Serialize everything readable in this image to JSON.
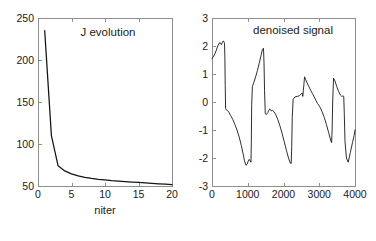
{
  "figure": {
    "background_color": "#ffffff",
    "axis_color": "#8e8e8e",
    "line_color": "#141414",
    "panel_count": 2
  },
  "chart_data": [
    {
      "id": "j-evolution",
      "type": "line",
      "title": "J evolution",
      "xlabel": "niter",
      "ylabel": "",
      "xlim": [
        0,
        20
      ],
      "ylim": [
        50,
        250
      ],
      "xticks": [
        0,
        5,
        10,
        15,
        20
      ],
      "xticklabels": [
        "0",
        "5",
        "10",
        "15",
        "20"
      ],
      "yticks": [
        50,
        100,
        150,
        200,
        250
      ],
      "yticklabels": [
        "50",
        "100",
        "150",
        "200",
        "250"
      ],
      "grid": false,
      "legend": null,
      "series": [
        {
          "name": "J",
          "x": [
            1,
            2,
            3,
            4,
            5,
            6,
            7,
            8,
            9,
            10,
            11,
            12,
            13,
            14,
            15,
            16,
            17,
            18,
            19,
            20
          ],
          "values": [
            235,
            110,
            74,
            68,
            64.5,
            62,
            60.3,
            59,
            58,
            57.2,
            56.4,
            55.8,
            55.2,
            54.7,
            54.2,
            53.8,
            53.2,
            52.6,
            52.1,
            51.5
          ]
        }
      ]
    },
    {
      "id": "denoised-signal",
      "type": "line",
      "title": "denoised signal",
      "xlabel": "",
      "ylabel": "",
      "xlim": [
        0,
        4000
      ],
      "ylim": [
        -3,
        3
      ],
      "xticks": [
        0,
        1000,
        2000,
        3000,
        4000
      ],
      "xticklabels": [
        "0",
        "1000",
        "2000",
        "3000",
        "4000"
      ],
      "yticks": [
        -3,
        -2,
        -1,
        0,
        1,
        2,
        3
      ],
      "yticklabels": [
        "-3",
        "-2",
        "-1",
        "0",
        "1",
        "2",
        "3"
      ],
      "grid": false,
      "legend": null,
      "series": [
        {
          "name": "denoised",
          "x": [
            0,
            40,
            80,
            120,
            160,
            200,
            230,
            260,
            290,
            310,
            330,
            350,
            360,
            370,
            380,
            400,
            430,
            470,
            520,
            580,
            640,
            700,
            760,
            820,
            870,
            910,
            950,
            985,
            1010,
            1040,
            1070,
            1090,
            1100,
            1110,
            1130,
            1170,
            1220,
            1270,
            1320,
            1370,
            1410,
            1440,
            1455,
            1470,
            1490,
            1520,
            1560,
            1590,
            1615,
            1640,
            1660,
            1690,
            1730,
            1780,
            1840,
            1900,
            1960,
            2020,
            2080,
            2140,
            2190,
            2215,
            2230,
            2245,
            2270,
            2320,
            2380,
            2440,
            2490,
            2520,
            2540,
            2555,
            2570,
            2590,
            2620,
            2660,
            2710,
            2760,
            2810,
            2860,
            2910,
            2950,
            2990,
            3030,
            3080,
            3140,
            3200,
            3260,
            3310,
            3345,
            3360,
            3375,
            3400,
            3440,
            3490,
            3540,
            3590,
            3630,
            3665,
            3685,
            3700,
            3720,
            3760,
            3810,
            3870,
            3930,
            3975,
            4000
          ],
          "values": [
            1.55,
            1.62,
            1.72,
            1.85,
            2.0,
            2.1,
            2.12,
            2.05,
            2.12,
            2.18,
            2.16,
            2.1,
            1.6,
            0.6,
            -0.22,
            -0.28,
            -0.3,
            -0.36,
            -0.48,
            -0.62,
            -0.8,
            -1.0,
            -1.25,
            -1.55,
            -1.85,
            -2.1,
            -2.26,
            -2.22,
            -2.12,
            -2.05,
            -2.1,
            -2.15,
            -1.4,
            -0.1,
            0.55,
            0.7,
            0.9,
            1.12,
            1.38,
            1.65,
            1.88,
            1.92,
            1.4,
            0.4,
            -0.42,
            -0.45,
            -0.38,
            -0.3,
            -0.25,
            -0.28,
            -0.32,
            -0.3,
            -0.34,
            -0.44,
            -0.62,
            -0.85,
            -1.12,
            -1.42,
            -1.72,
            -2.0,
            -2.18,
            -2.2,
            -1.6,
            -0.55,
            0.1,
            0.18,
            0.2,
            0.22,
            0.28,
            0.32,
            0.2,
            0.42,
            0.62,
            0.9,
            0.8,
            0.68,
            0.55,
            0.42,
            0.3,
            0.18,
            0.05,
            -0.05,
            -0.12,
            -0.2,
            -0.35,
            -0.55,
            -0.8,
            -1.08,
            -1.32,
            -1.45,
            -1.0,
            0.0,
            0.85,
            0.75,
            0.55,
            0.38,
            0.25,
            0.2,
            0.22,
            0.2,
            -0.4,
            -1.4,
            -2.0,
            -2.15,
            -1.8,
            -1.45,
            -1.2,
            -1.0
          ]
        }
      ]
    }
  ]
}
